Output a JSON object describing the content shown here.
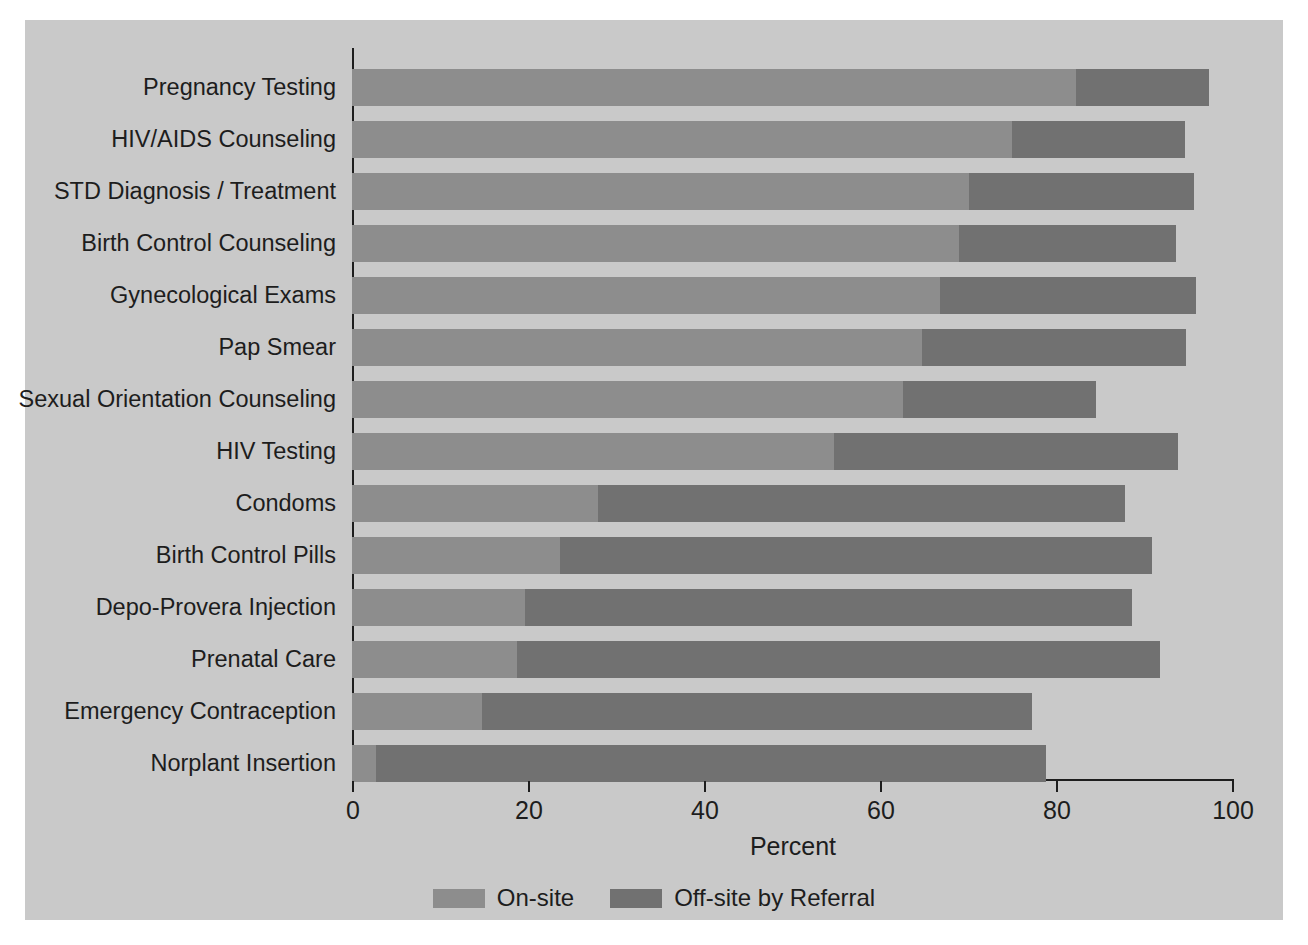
{
  "chart_data": {
    "type": "bar",
    "orientation": "horizontal",
    "stacked": true,
    "title": "",
    "xlabel": "Percent",
    "ylabel": "",
    "xlim": [
      0,
      100
    ],
    "xticks": [
      0,
      20,
      40,
      60,
      80,
      100
    ],
    "xtick_labels": [
      "0",
      "20",
      "40",
      "60",
      "80",
      "100"
    ],
    "grid": false,
    "legend_position": "bottom-center",
    "legend": [
      "On-site",
      "Off-site by Referral"
    ],
    "colors": {
      "on_site": "#8d8d8d",
      "off_site": "#717171",
      "background": "#c9c9c9",
      "axis": "#1d1d1d",
      "text": "#1d1d1d"
    },
    "categories": [
      "Pregnancy Testing",
      "HIV/AIDS Counseling",
      "STD Diagnosis / Treatment",
      "Birth Control Counseling",
      "Gynecological Exams",
      "Pap Smear",
      "Sexual Orientation Counseling",
      "HIV Testing",
      "Condoms",
      "Birth Control Pills",
      "Depo-Provera Injection",
      "Prenatal Care",
      "Emergency Contraception",
      "Norplant Insertion"
    ],
    "series": [
      {
        "name": "On-site",
        "color": "#8d8d8d",
        "values": [
          82.3,
          75.0,
          70.1,
          69.0,
          66.8,
          64.8,
          62.6,
          54.8,
          28.0,
          23.6,
          19.7,
          18.7,
          14.8,
          2.7
        ]
      },
      {
        "name": "Off-site by Referral",
        "color": "#717171",
        "values": [
          15.1,
          19.7,
          25.6,
          24.6,
          29.1,
          30.0,
          22.0,
          39.1,
          59.8,
          67.3,
          68.9,
          73.1,
          62.5,
          76.2
        ]
      }
    ],
    "totals": [
      97.4,
      94.7,
      95.7,
      93.6,
      95.9,
      94.8,
      84.6,
      93.9,
      87.8,
      90.9,
      88.6,
      91.8,
      77.3,
      78.9
    ]
  }
}
